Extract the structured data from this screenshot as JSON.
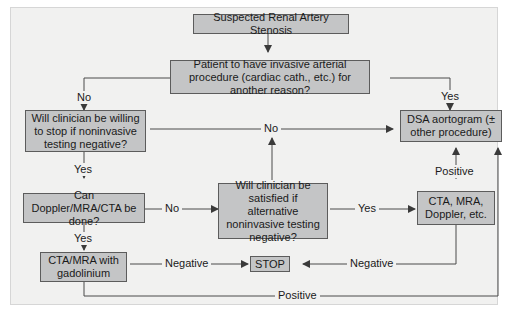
{
  "diagram": {
    "nodes": {
      "start": "Suspected Renal Artery Stenosis",
      "invasive_q": "Patient to have invasive arterial procedure (cardiac cath., etc.) for another reason?",
      "willing_q": "Will clinician be willing to stop if noninvasive testing negative?",
      "can_do_q": "Can Doppler/MRA/CTA be done?",
      "satisfied_q": "Will clinician be satisfied if alternative noninvasive testing negative?",
      "cta_mra": "CTA/MRA with gadolinium",
      "stop": "STOP",
      "alt_tests": "CTA, MRA, Doppler, etc.",
      "dsa": "DSA aortogram (± other procedure)"
    },
    "edge_labels": {
      "invasive_no": "No",
      "invasive_yes": "Yes",
      "willing_no": "No",
      "willing_yes": "Yes",
      "can_do_no": "No",
      "can_do_yes": "Yes",
      "satisfied_yes": "Yes",
      "alt_positive": "Positive",
      "alt_negative": "Negative",
      "cta_negative": "Negative",
      "cta_positive": "Positive"
    }
  }
}
